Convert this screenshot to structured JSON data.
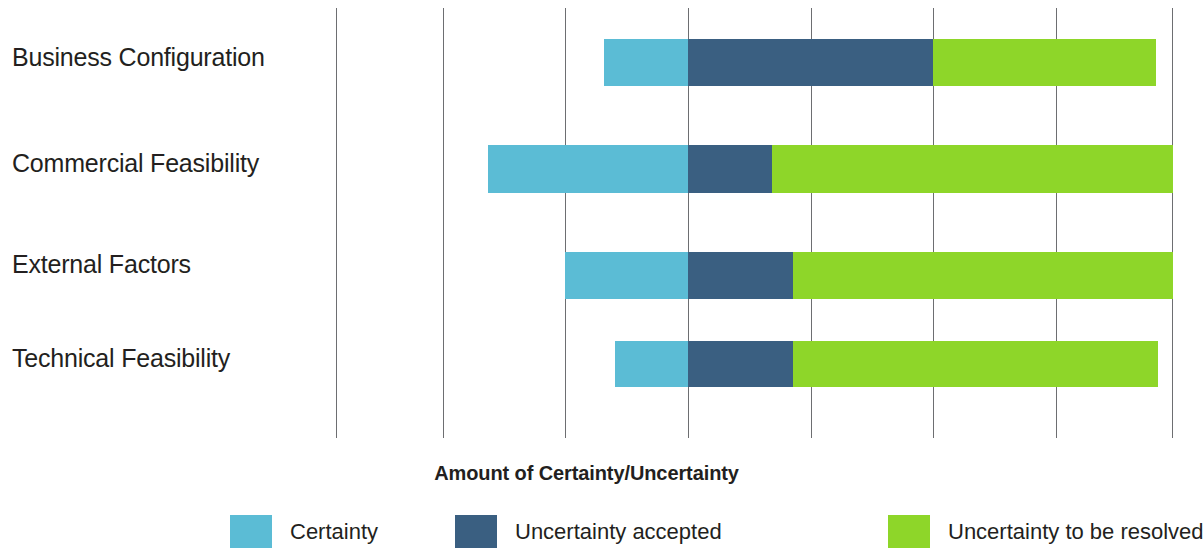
{
  "chart_data": {
    "type": "bar",
    "subtype": "stacked-horizontal-floating",
    "title": "",
    "xlabel": "Amount of Certainty/Uncertainty",
    "ylabel": "",
    "categories": [
      "Business Configuration",
      "Commercial Feasibility",
      "External Factors",
      "Technical Feasibility"
    ],
    "series": [
      {
        "name": "Certainty",
        "color": "#5bbcd5",
        "values": [
          0.69,
          1.63,
          1.0,
          0.6
        ]
      },
      {
        "name": "Uncertainty accepted",
        "color": "#3a5f81",
        "values": [
          2.0,
          0.69,
          0.86,
          0.86
        ]
      },
      {
        "name": "Uncertainty to be resolved",
        "color": "#8ed629",
        "values": [
          1.82,
          3.27,
          3.1,
          2.98
        ]
      }
    ],
    "bars": [
      {
        "category": "Business Configuration",
        "certainty_start": -0.69,
        "certainty": 0.69,
        "accepted": 2.0,
        "resolved": 1.82,
        "total": 4.51
      },
      {
        "category": "Commercial Feasibility",
        "certainty_start": -1.63,
        "certainty": 1.63,
        "accepted": 0.69,
        "resolved": 3.27,
        "total": 5.59
      },
      {
        "category": "External Factors",
        "certainty_start": -1.0,
        "certainty": 1.0,
        "accepted": 0.86,
        "resolved": 3.1,
        "total": 4.96
      },
      {
        "category": "Technical Feasibility",
        "certainty_start": -0.6,
        "certainty": 0.6,
        "accepted": 0.86,
        "resolved": 2.98,
        "total": 4.44
      }
    ],
    "gridlines": [
      -2.87,
      -2.0,
      -1.0,
      0.0,
      1.0,
      2.0,
      3.0,
      3.96
    ],
    "xlim": [
      -2.87,
      3.96
    ],
    "grid": true,
    "legend_position": "bottom",
    "legend": [
      "Certainty",
      "Uncertainty accepted",
      "Uncertainty to be resolved"
    ]
  },
  "axis": {
    "title": "Amount of Certainty/Uncertainty"
  },
  "categories": [
    {
      "label": "Business Configuration"
    },
    {
      "label": "Commercial Feasibility"
    },
    {
      "label": "External Factors"
    },
    {
      "label": "Technical Feasibility"
    }
  ],
  "legend": {
    "items": [
      {
        "label": "Certainty",
        "color": "#5bbcd5"
      },
      {
        "label": "Uncertainty accepted",
        "color": "#3a5f81"
      },
      {
        "label": "Uncertainty to be resolved",
        "color": "#8ed629"
      }
    ]
  },
  "colors": {
    "certainty": "#5bbcd5",
    "uncertainty_accepted": "#3a5f81",
    "uncertainty_to_be_resolved": "#8ed629",
    "gridline": "#6d6e71",
    "text": "#231f20",
    "background": "#ffffff"
  },
  "_layout": {
    "gridline_x": [
      336,
      443,
      565,
      688,
      811,
      933,
      1056,
      1172
    ],
    "rows": [
      {
        "y": 39,
        "h": 47,
        "label_y": 43,
        "seg": [
          604,
          688,
          933,
          1156
        ]
      },
      {
        "y": 145,
        "h": 48,
        "label_y": 149,
        "seg": [
          488,
          688,
          772,
          1173
        ]
      },
      {
        "y": 252,
        "h": 47,
        "label_y": 250,
        "seg": [
          565,
          688,
          793,
          1173
        ]
      },
      {
        "y": 341,
        "h": 46,
        "label_y": 344,
        "seg": [
          615,
          688,
          793,
          1158
        ]
      }
    ],
    "legend_x": [
      230,
      455,
      888
    ]
  }
}
